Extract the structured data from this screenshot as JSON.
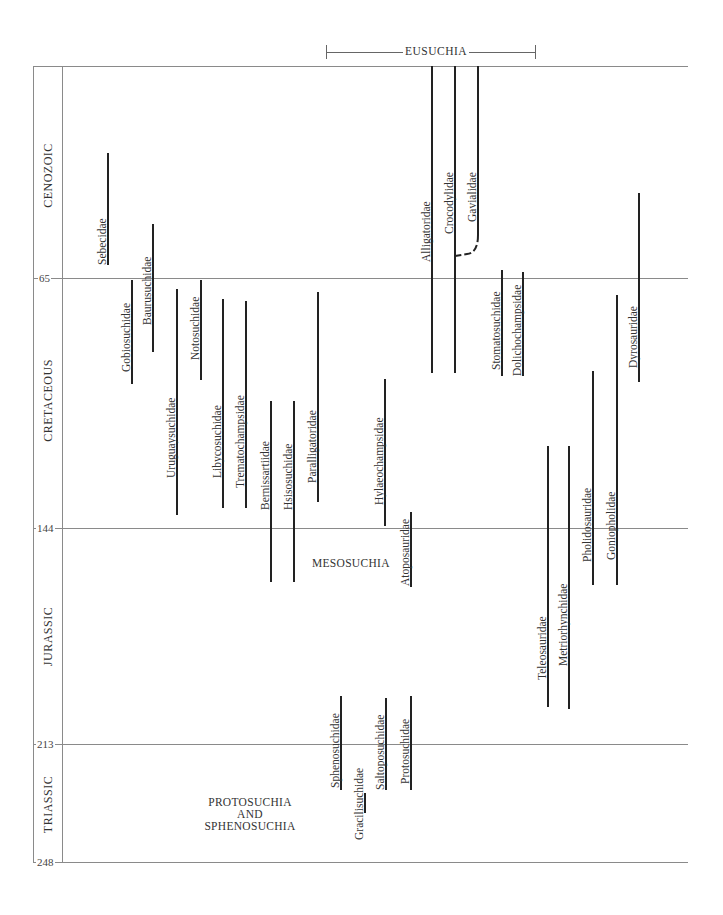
{
  "diagram": {
    "type": "phylogenetic-range-chart",
    "clade_bracket": {
      "label": "EUSUCHIA",
      "x_start": 326,
      "x_end": 535,
      "y": 52
    },
    "time_axis": {
      "unit": "Ma",
      "boundaries": [
        {
          "label": "65",
          "y": 278
        },
        {
          "label": "144",
          "y": 528
        },
        {
          "label": "213",
          "y": 744
        },
        {
          "label": "248",
          "y": 862
        }
      ],
      "top_y": 66
    },
    "periods": [
      {
        "label": "CENOZOIC",
        "center_y": 175
      },
      {
        "label": "CRETACEOUS",
        "center_y": 400
      },
      {
        "label": "JURASSIC",
        "center_y": 636
      },
      {
        "label": "TRIASSIC",
        "center_y": 804
      }
    ],
    "groups": [
      {
        "label": "MESOSUCHIA",
        "lines": [
          "MESOSUCHIA"
        ],
        "x": 312,
        "y": 556
      },
      {
        "label": "PROTOSUCHIA AND SPHENOSUCHIA",
        "lines": [
          "PROTOSUCHIA",
          "AND",
          "SPHENOSUCHIA"
        ],
        "x": 249,
        "y": 796
      }
    ],
    "families": [
      {
        "name": "Sebecidae",
        "x": 108,
        "y_top": 153,
        "y_bottom": 265,
        "label_bottom": 265
      },
      {
        "name": "Gobiosuchidae",
        "x": 132,
        "y_top": 280,
        "y_bottom": 384,
        "label_bottom": 372
      },
      {
        "name": "Baurusuchidae",
        "x": 153,
        "y_top": 224,
        "y_bottom": 352,
        "label_bottom": 325
      },
      {
        "name": "Uruguaysuchidae",
        "x": 177,
        "y_top": 289,
        "y_bottom": 515,
        "label_bottom": 478
      },
      {
        "name": "Notosuchidae",
        "x": 201,
        "y_top": 280,
        "y_bottom": 380,
        "label_bottom": 360
      },
      {
        "name": "Libycosuchidae",
        "x": 223,
        "y_top": 299,
        "y_bottom": 508,
        "label_bottom": 478
      },
      {
        "name": "Trematochampsidae",
        "x": 246,
        "y_top": 301,
        "y_bottom": 508,
        "label_bottom": 488
      },
      {
        "name": "Bernissartiidae",
        "x": 271,
        "y_top": 401,
        "y_bottom": 582,
        "label_bottom": 510
      },
      {
        "name": "Hsisosuchidae",
        "x": 294,
        "y_top": 401,
        "y_bottom": 582,
        "label_bottom": 510
      },
      {
        "name": "Paralligatoridae",
        "x": 318,
        "y_top": 292,
        "y_bottom": 502,
        "label_bottom": 483
      },
      {
        "name": "Hylaeochampsidae",
        "x": 385,
        "y_top": 379,
        "y_bottom": 526,
        "label_bottom": 505
      },
      {
        "name": "Atoposauridae",
        "x": 411,
        "y_top": 512,
        "y_bottom": 587,
        "label_bottom": 586
      },
      {
        "name": "Alligatoridae",
        "x": 432,
        "y_top": 66,
        "y_bottom": 373,
        "label_bottom": 262
      },
      {
        "name": "Crocodylidae",
        "x": 455,
        "y_top": 66,
        "y_bottom": 373,
        "label_bottom": 234
      },
      {
        "name": "Gavialidae",
        "x": 478,
        "y_top": 66,
        "y_bottom": 235,
        "label_bottom": 222,
        "dashed_join_to_x": 455,
        "dashed_join_y": 255
      },
      {
        "name": "Stomatosuchidae",
        "x": 502,
        "y_top": 270,
        "y_bottom": 376,
        "label_bottom": 370
      },
      {
        "name": "Dolichochampsidae",
        "x": 523,
        "y_top": 272,
        "y_bottom": 376,
        "label_bottom": 376
      },
      {
        "name": "Teleosauridae",
        "x": 548,
        "y_top": 446,
        "y_bottom": 707,
        "label_bottom": 680
      },
      {
        "name": "Metriorhynchidae",
        "x": 569,
        "y_top": 446,
        "y_bottom": 709,
        "label_bottom": 666
      },
      {
        "name": "Pholidosauridae",
        "x": 593,
        "y_top": 371,
        "y_bottom": 585,
        "label_bottom": 562
      },
      {
        "name": "Goniopholidae",
        "x": 617,
        "y_top": 295,
        "y_bottom": 585,
        "label_bottom": 560
      },
      {
        "name": "Dyrosauridae",
        "x": 639,
        "y_top": 193,
        "y_bottom": 382,
        "label_bottom": 368
      },
      {
        "name": "Sphenosuchidae",
        "x": 341,
        "y_top": 696,
        "y_bottom": 790,
        "label_bottom": 788
      },
      {
        "name": "Gracilisuchidae",
        "x": 365,
        "y_top": 793,
        "y_bottom": 813,
        "label_bottom": 840
      },
      {
        "name": "Saltoposuchidae",
        "x": 386,
        "y_top": 698,
        "y_bottom": 790,
        "label_bottom": 790
      },
      {
        "name": "Protosuchidae",
        "x": 411,
        "y_top": 696,
        "y_bottom": 790,
        "label_bottom": 784
      }
    ]
  }
}
